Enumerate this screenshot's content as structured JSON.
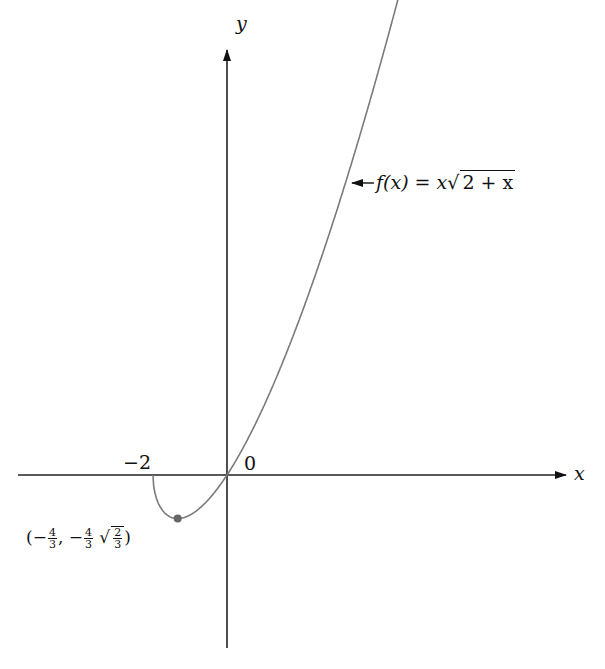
{
  "chart_data": {
    "type": "line",
    "title": "",
    "function_label": "f(x) = x√(2 + x)",
    "xlabel": "x",
    "ylabel": "y",
    "domain_start": -2,
    "xlim": [
      -5.8,
      10.4
    ],
    "ylim": [
      -4.7,
      11.6
    ],
    "grid": false,
    "tick_labels": [
      "−2",
      "0"
    ],
    "annotations": [
      {
        "text": "(−4/3, −4/3 √(2/3))",
        "x": -1.3333,
        "y": -1.0887,
        "marker": "dot"
      },
      {
        "text": "f(x) = x√(2 + x)",
        "arrow_to_curve": true
      }
    ],
    "series": [
      {
        "name": "f(x) = x√(2 + x)",
        "x": [
          -2,
          -1.9,
          -1.75,
          -1.5,
          -1.3333,
          -1,
          -0.5,
          0,
          0.5,
          1,
          1.5,
          2,
          2.5,
          3,
          3.5,
          4,
          4.5
        ],
        "y": [
          0,
          -0.601,
          -0.875,
          -1.061,
          -1.089,
          -1.0,
          -0.612,
          0,
          0.791,
          1.732,
          2.806,
          4.0,
          5.303,
          6.708,
          8.208,
          9.798,
          11.473
        ]
      }
    ],
    "colors": {
      "curve": "#7a7a7a",
      "axes": "#222222",
      "point": "#666666"
    }
  },
  "labels": {
    "y_axis": "y",
    "x_axis": "x",
    "tick_neg2": "−2",
    "tick_0": "0",
    "func_prefix": "f(x) = x",
    "func_radicand": "2 + x",
    "point_open": "(−",
    "point_num": "4",
    "point_den": "3",
    "point_mid": ", −",
    "point_num2": "4",
    "point_den2": "3",
    "point_rad_num": "2",
    "point_rad_den": "3",
    "point_close": ")"
  }
}
